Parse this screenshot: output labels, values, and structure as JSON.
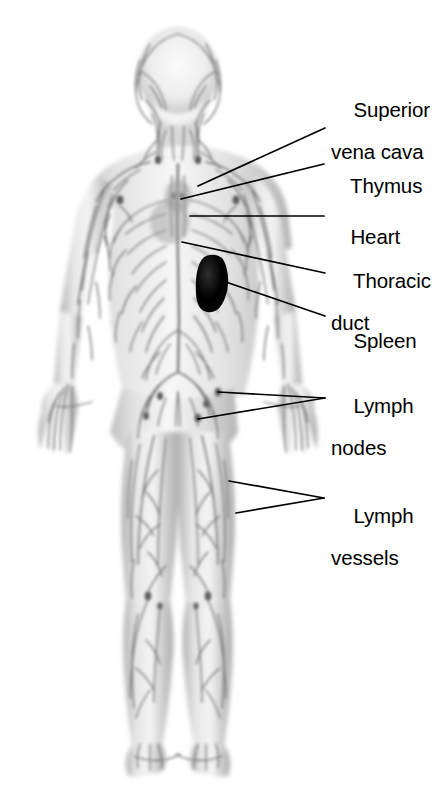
{
  "diagram": {
    "background_color": "#ffffff",
    "line_color": "#000000",
    "body_fill_light": "#f2f2f2",
    "body_fill_mid": "#c9c9c9",
    "vessel_color": "#6e6e6e",
    "spleen_color": "#141414"
  },
  "labels": [
    {
      "id": "superior-vena-cava",
      "line1": "Superior",
      "line2": "vena cava",
      "text_x": 331,
      "text_y": 78,
      "leader": [
        [
          325,
          128
        ],
        [
          198,
          186
        ]
      ]
    },
    {
      "id": "thymus",
      "line1": "Thymus",
      "line2": "",
      "text_x": 328,
      "text_y": 154,
      "leader": [
        [
          324,
          164
        ],
        [
          181,
          199
        ]
      ]
    },
    {
      "id": "heart",
      "line1": "Heart",
      "line2": "",
      "text_x": 328,
      "text_y": 205,
      "leader": [
        [
          324,
          216
        ],
        [
          190,
          216
        ]
      ]
    },
    {
      "id": "thoracic-duct",
      "line1": "Thoracic",
      "line2": "duct",
      "text_x": 331,
      "text_y": 249,
      "leader": [
        [
          325,
          273
        ],
        [
          182,
          242
        ]
      ]
    },
    {
      "id": "spleen",
      "line1": "Spleen",
      "line2": "",
      "text_x": 331,
      "text_y": 309,
      "leader": [
        [
          325,
          316
        ],
        [
          223,
          281
        ]
      ]
    },
    {
      "id": "lymph-nodes",
      "line1": "Lymph",
      "line2": "nodes",
      "text_x": 331,
      "text_y": 374,
      "leader": [
        [
          325,
          398
        ],
        [
          218,
          392
        ]
      ],
      "leader2": [
        [
          325,
          398
        ],
        [
          198,
          419
        ]
      ]
    },
    {
      "id": "lymph-vessels",
      "line1": "Lymph",
      "line2": "vessels",
      "text_x": 331,
      "text_y": 484,
      "leader": [
        [
          324,
          498
        ],
        [
          229,
          481
        ]
      ],
      "leader2": [
        [
          324,
          498
        ],
        [
          236,
          513
        ]
      ]
    }
  ],
  "anatomy_parts": [
    "head",
    "neck",
    "shoulders",
    "torso",
    "arms",
    "hands",
    "pelvis",
    "legs",
    "feet",
    "spleen",
    "lymph-vessel-network",
    "lymph-nodes"
  ]
}
